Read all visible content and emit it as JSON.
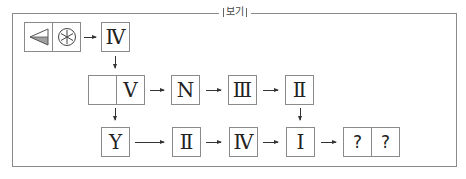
{
  "legend": {
    "label": "보기"
  },
  "row1": {
    "symbols": [
      {
        "icon": "left-triangle-half-shaded-icon"
      },
      {
        "icon": "circled-asterisk-icon"
      }
    ],
    "next": "Ⅳ"
  },
  "row2": {
    "split": [
      "",
      "Ⅴ"
    ],
    "boxes": [
      "N",
      "Ⅲ",
      "Ⅱ"
    ]
  },
  "row3": {
    "boxes": [
      "Y",
      "Ⅱ",
      "Ⅳ",
      "Ⅰ"
    ],
    "answer": [
      "?",
      "?"
    ]
  },
  "colors": {
    "border": "#8a8a8a",
    "shade": "#a0a0a0",
    "arrow": "#333333"
  }
}
